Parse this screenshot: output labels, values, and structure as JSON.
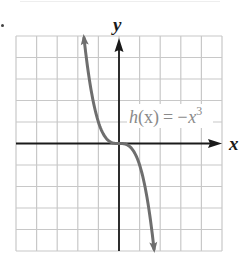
{
  "chart_data": {
    "type": "line",
    "title": "",
    "xlabel": "x",
    "ylabel": "y",
    "xlim": [
      -5,
      5
    ],
    "ylim": [
      -5,
      5
    ],
    "grid": true,
    "grid_step": 1,
    "legend": null,
    "annotation": "h(x) = −x³",
    "series": [
      {
        "name": "h(x) = -x^3",
        "function": "-x^3",
        "domain": [
          -1.7,
          1.7
        ],
        "arrows_at_ends": true,
        "x": [
          -1.7,
          -1.5,
          -1.25,
          -1.0,
          -0.75,
          -0.5,
          -0.25,
          0,
          0.25,
          0.5,
          0.75,
          1.0,
          1.25,
          1.5,
          1.7
        ],
        "y": [
          4.913,
          3.375,
          1.953,
          1.0,
          0.422,
          0.125,
          0.016,
          0,
          -0.016,
          -0.125,
          -0.422,
          -1.0,
          -1.953,
          -3.375,
          -4.913
        ]
      }
    ]
  },
  "labels": {
    "x_axis": "x",
    "y_axis": "y",
    "func_name": "h",
    "func_arg": "(x)",
    "equals": "=",
    "rhs": "−x",
    "exponent": "3"
  },
  "colors": {
    "grid": "#c8c8c8",
    "axis": "#1a1a1a",
    "curve": "#6e6e6e",
    "label": "#8a8a8a"
  }
}
